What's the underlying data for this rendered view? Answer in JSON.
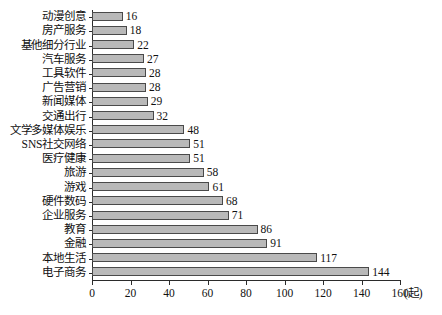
{
  "chart_data": {
    "type": "bar",
    "orientation": "horizontal",
    "title": "",
    "xlabel": "",
    "ylabel": "",
    "unit_label": "(起)",
    "xlim": [
      0,
      160
    ],
    "xticks": [
      0,
      20,
      40,
      60,
      80,
      100,
      120,
      140,
      160
    ],
    "grid": false,
    "legend": null,
    "bar_fill_color": "#b9b9b9",
    "bar_border_color": "#4a4a4a",
    "axis_color": "#2b2b2b",
    "categories": [
      "动漫创意",
      "房产服务",
      "基他细分行业",
      "汽车服务",
      "工具软件",
      "广告营销",
      "新闻媒体",
      "交通出行",
      "文学多媒体娱乐",
      "SNS社交网络",
      "医疗健康",
      "旅游",
      "游戏",
      "硬件数码",
      "企业服务",
      "教育",
      "金融",
      "本地生活",
      "电子商务"
    ],
    "values": [
      16,
      18,
      22,
      27,
      28,
      28,
      29,
      32,
      48,
      51,
      51,
      58,
      61,
      68,
      71,
      86,
      91,
      117,
      144
    ],
    "value_labels": [
      "16",
      "18",
      "22",
      "27",
      "28",
      "28",
      "29",
      "32",
      "48",
      "51",
      "51",
      "58",
      "61",
      "68",
      "71",
      "86",
      "91",
      "117",
      "144"
    ],
    "xtick_labels": [
      "0",
      "20",
      "40",
      "60",
      "80",
      "100",
      "120",
      "140",
      "160"
    ]
  }
}
